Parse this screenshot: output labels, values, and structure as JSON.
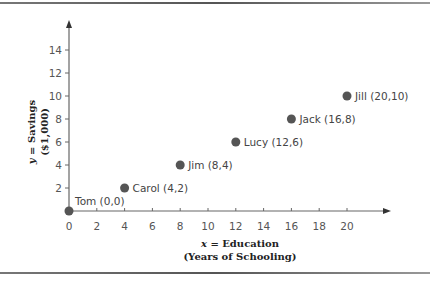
{
  "chart_data": {
    "type": "scatter",
    "title": "",
    "xlabel": "x = Education (Years of Schooling)",
    "ylabel": "y = Savings ($1,000)",
    "xlabel_lines": [
      "x = Education",
      "(Years of Schooling)"
    ],
    "ylabel_lines": [
      "y = Savings",
      "($1,000)"
    ],
    "xlim": [
      0,
      22
    ],
    "ylim": [
      0,
      16
    ],
    "x_ticks": [
      0,
      2,
      4,
      6,
      8,
      10,
      12,
      14,
      16,
      18,
      20
    ],
    "y_ticks": [
      2,
      4,
      6,
      8,
      10,
      12,
      14
    ],
    "grid": false,
    "legend": null,
    "point_color": "#555555",
    "points": [
      {
        "name": "Tom",
        "x": 0,
        "y": 0,
        "label": "Tom (0,0)"
      },
      {
        "name": "Carol",
        "x": 4,
        "y": 2,
        "label": "Carol (4,2)"
      },
      {
        "name": "Jim",
        "x": 8,
        "y": 4,
        "label": "Jim (8,4)"
      },
      {
        "name": "Lucy",
        "x": 12,
        "y": 6,
        "label": "Lucy (12,6)"
      },
      {
        "name": "Jack",
        "x": 16,
        "y": 8,
        "label": "Jack (16,8)"
      },
      {
        "name": "Jill",
        "x": 20,
        "y": 10,
        "label": "Jill (20,10)"
      }
    ]
  }
}
